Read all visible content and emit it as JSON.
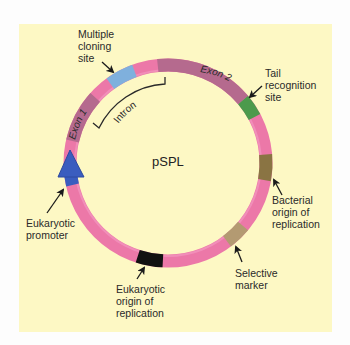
{
  "title": "pSPL",
  "plasmid": {
    "name": "pSPL",
    "center": [
      168,
      163
    ],
    "radius": 98,
    "ring_width": 13,
    "base_color": "#ec78a8"
  },
  "segments": [
    {
      "name": "exon-1",
      "label": "Exon 1",
      "start": 193,
      "end": 222,
      "color": "#b56a8e"
    },
    {
      "name": "multiple-cloning-site",
      "label": "Multiple cloning site",
      "start": 234,
      "end": 250,
      "color": "#7fb0dd"
    },
    {
      "name": "exon-2",
      "label": "Exon 2",
      "start": 264,
      "end": 320,
      "color": "#b56a8e"
    },
    {
      "name": "tail-recognition-site",
      "label": "Tail recognition site",
      "start": 320,
      "end": 332,
      "color": "#4c9a4c"
    },
    {
      "name": "bacterial-origin",
      "label": "Bacterial origin of replication",
      "start": 355,
      "end": 370,
      "color": "#8a7443"
    },
    {
      "name": "selective-marker",
      "label": "Selective marker",
      "start": 40,
      "end": 53,
      "color": "#b39a72"
    },
    {
      "name": "eukaryotic-origin",
      "label": "Eukaryotic origin of replication",
      "start": 93,
      "end": 108,
      "color": "#111111"
    },
    {
      "name": "eukaryotic-promoter",
      "label": "Eukaryotic promoter",
      "start": 167,
      "end": 178,
      "color": "#3a5dbf"
    }
  ],
  "labels": {
    "center": "pSPL",
    "mcs": "Multiple\ncloning\nsite",
    "tail": "Tail\nrecognition\nsite",
    "bacterial_ori": "Bacterial\norigin of\nreplication",
    "selective_marker": "Selective\nmarker",
    "eukaryotic_ori": "Eukaryotic\norigin of\nreplication",
    "promoter": "Eukaryotic\npromoter",
    "exon1": "Exon 1",
    "exon2": "Exon 2",
    "intron": "Intron"
  },
  "colors": {
    "background": "#fdf8c4",
    "ring": "#ec78a8",
    "promoter_arrow": "#3a5dbf",
    "text": "#2a2a2a"
  }
}
